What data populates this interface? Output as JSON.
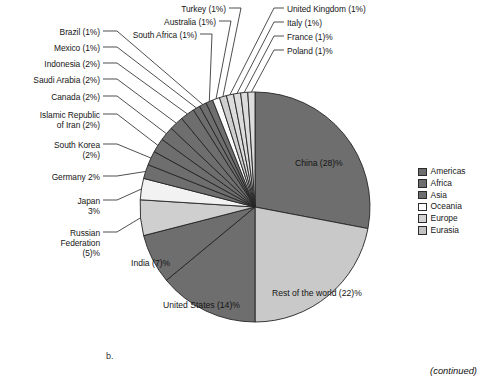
{
  "figure": {
    "panel_letter": "b.",
    "continued_note": "(continued)"
  },
  "legend": {
    "position": "right",
    "items": [
      {
        "label": "Americas",
        "color": "#6e6e6e"
      },
      {
        "label": "Africa",
        "color": "#6e6e6e"
      },
      {
        "label": "Asia",
        "color": "#6e6e6e"
      },
      {
        "label": "Oceania",
        "color": "#ffffff"
      },
      {
        "label": "Europe",
        "color": "#d3d3d3"
      },
      {
        "label": "Eurasia",
        "color": "#c2c2c2"
      }
    ]
  },
  "callouts": {
    "left": [
      {
        "name": "brazil",
        "text": "Brazil (1%)"
      },
      {
        "name": "mexico",
        "text": "Mexico (1%)"
      },
      {
        "name": "indonesia",
        "text": "Indonesia (2%)"
      },
      {
        "name": "saudi-arabia",
        "text": "Saudi Arabia (2%)"
      },
      {
        "name": "canada",
        "text": "Canada (2%)"
      },
      {
        "name": "iran",
        "text": "Islamic Republic\nof Iran (2%)"
      },
      {
        "name": "south-korea",
        "text": "South Korea\n(2%)"
      },
      {
        "name": "germany",
        "text": "Germany 2%"
      },
      {
        "name": "japan",
        "text": "Japan\n3%"
      },
      {
        "name": "russia",
        "text": "Russian\nFederation\n(5)%"
      }
    ],
    "top": [
      {
        "name": "south-africa",
        "text": "South Africa (1%)"
      },
      {
        "name": "australia",
        "text": "Australia (1%)"
      },
      {
        "name": "turkey",
        "text": "Turkey (1%)"
      }
    ],
    "top_right": [
      {
        "name": "united-kingdom",
        "text": "United Kingdom (1%)"
      },
      {
        "name": "italy",
        "text": "Italy (1%)"
      },
      {
        "name": "france",
        "text": "France (1)%"
      },
      {
        "name": "poland",
        "text": "Poland (1)%"
      }
    ],
    "inside": [
      {
        "name": "china",
        "text": "China (28)%"
      },
      {
        "name": "rest-of-world",
        "text": "Rest of the world (22)%"
      },
      {
        "name": "united-states",
        "text": "United States (14)%"
      },
      {
        "name": "india",
        "text": "India (7)%"
      }
    ]
  },
  "chart_data": {
    "type": "pie",
    "title": "",
    "units": "percent of total",
    "total": 100,
    "start_angle_deg": 0,
    "direction": "clockwise",
    "legend_position": "right",
    "categories": [
      "China",
      "Rest of the world",
      "United States",
      "India",
      "Russian Federation",
      "Japan",
      "Germany",
      "South Korea",
      "Islamic Republic of Iran",
      "Canada",
      "Saudi Arabia",
      "Indonesia",
      "Mexico",
      "Brazil",
      "South Africa",
      "Australia",
      "Turkey",
      "United Kingdom",
      "Italy",
      "France",
      "Poland"
    ],
    "values": [
      28,
      22,
      14,
      7,
      5,
      3,
      2,
      2,
      2,
      2,
      2,
      2,
      1,
      1,
      1,
      1,
      1,
      1,
      1,
      1,
      1
    ],
    "labels": [
      "China (28)%",
      "Rest of the world (22)%",
      "United States (14)%",
      "India (7)%",
      "Russian Federation (5)%",
      "Japan 3%",
      "Germany 2%",
      "South Korea (2%)",
      "Islamic Republic of Iran (2%)",
      "Canada (2%)",
      "Saudi Arabia (2%)",
      "Indonesia (2%)",
      "Mexico (1%)",
      "Brazil (1%)",
      "South Africa (1%)",
      "Australia (1%)",
      "Turkey (1%)",
      "United Kingdom (1%)",
      "Italy (1%)",
      "France (1)%",
      "Poland (1)%"
    ],
    "groups": [
      "Asia",
      "Rest of the world",
      "Americas",
      "Asia",
      "Eurasia",
      "Asia",
      "Europe",
      "Asia",
      "Asia",
      "Americas",
      "Asia",
      "Asia",
      "Americas",
      "Americas",
      "Africa",
      "Oceania",
      "Eurasia",
      "Europe",
      "Europe",
      "Europe",
      "Europe"
    ],
    "slice_colors": [
      "#6e6e6e",
      "#c9c9c9",
      "#6e6e6e",
      "#6e6e6e",
      "#cfcfcf",
      "#f2f2f2",
      "#6e6e6e",
      "#6e6e6e",
      "#6e6e6e",
      "#6e6e6e",
      "#6e6e6e",
      "#6e6e6e",
      "#6e6e6e",
      "#6e6e6e",
      "#6e6e6e",
      "#fbfbfb",
      "#cfcfcf",
      "#dcdcdc",
      "#dcdcdc",
      "#dcdcdc",
      "#dcdcdc"
    ]
  }
}
